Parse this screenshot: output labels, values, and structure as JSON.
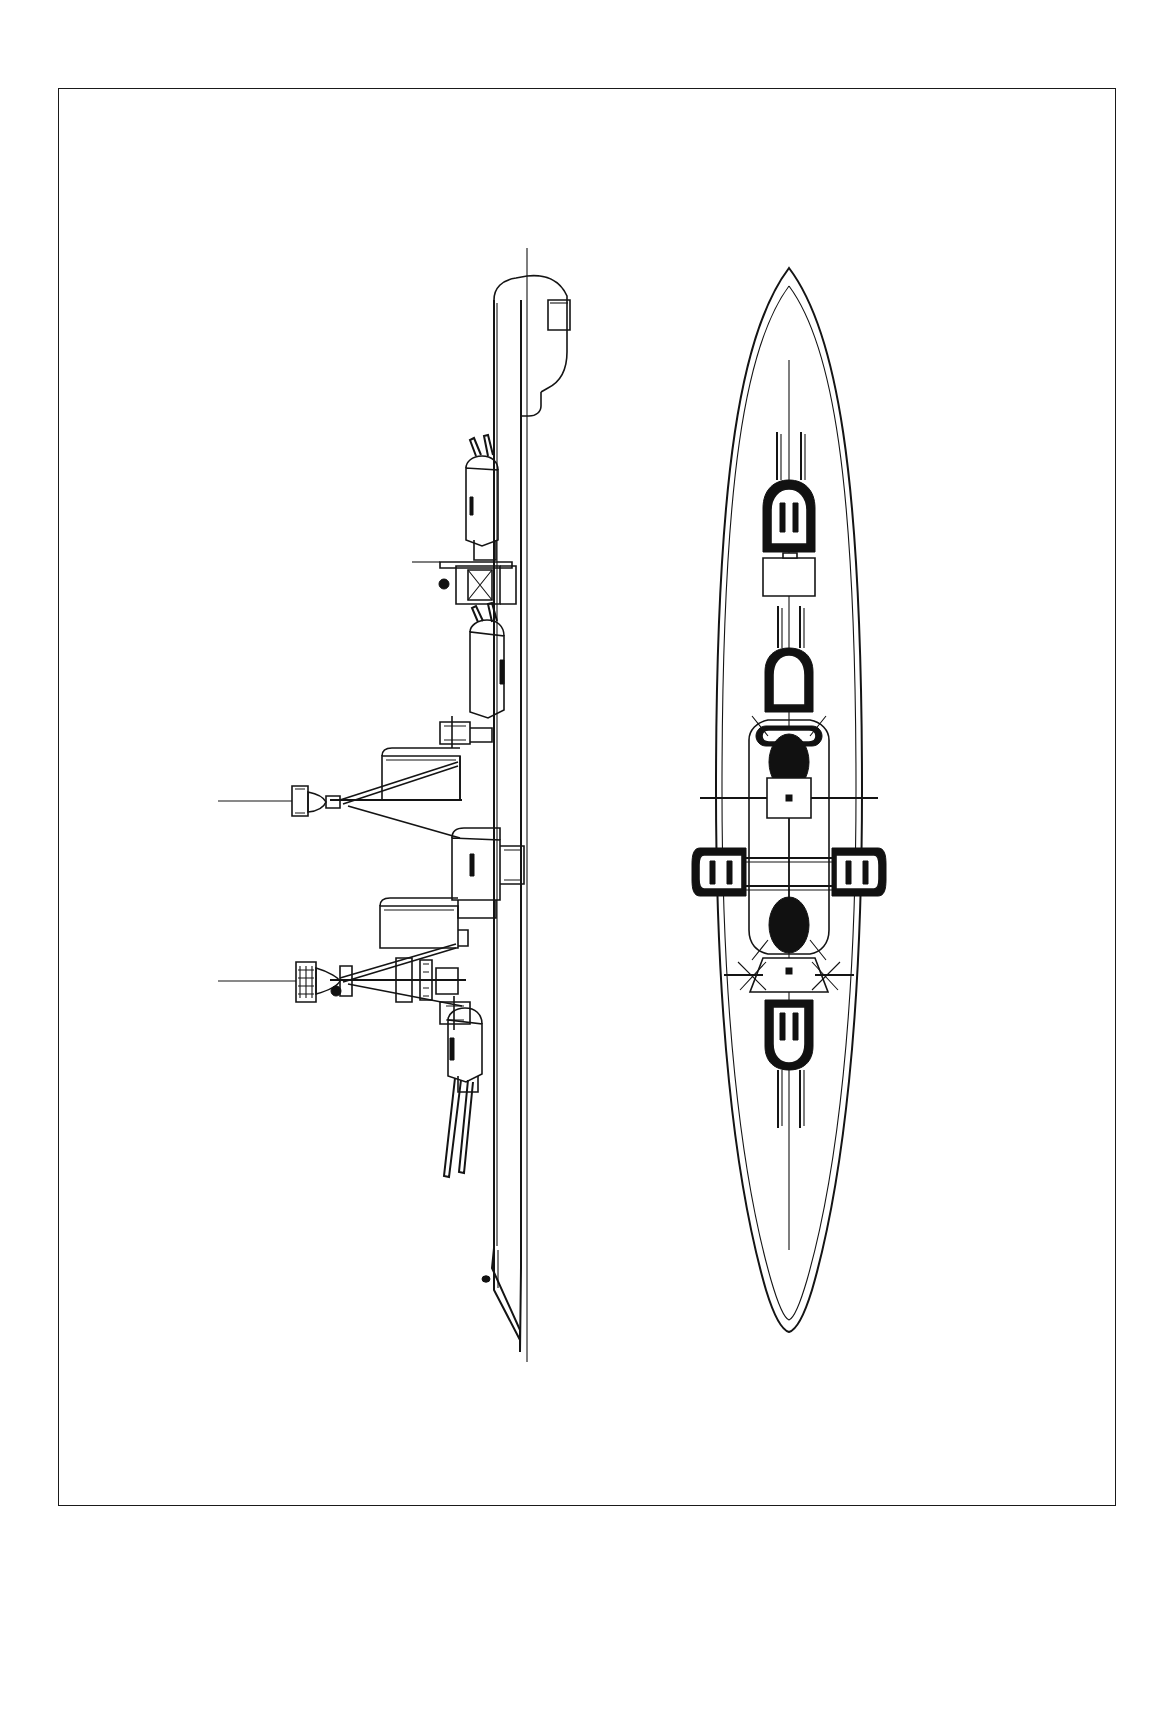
{
  "sheet": {
    "title": "Battleship general arrangement drawing",
    "background_color": "#ffffff",
    "line_color": "#1a1a1a",
    "width_px": 1174,
    "height_px": 1716,
    "orientation": "portrait, ship drawn rotated 90 degrees (bow toward bottom of sheet)"
  },
  "frame": {
    "name": "drawing-border",
    "x": 58,
    "y": 88,
    "width": 1058,
    "height": 1418,
    "stroke": "#1a1a1a",
    "stroke_width": 1.5
  },
  "views": {
    "elevation": {
      "label": "side elevation",
      "centerline_x": 527,
      "bow_y": 1360,
      "stern_y": 248,
      "hull_left_x": 466,
      "hull_right_x": 583
    },
    "plan": {
      "label": "deck plan view",
      "centerline_x": 789,
      "bow_y": 1330,
      "stern_y": 268,
      "beam_half_width": 73
    }
  },
  "armament": {
    "main_turrets": [
      {
        "name": "turret-a",
        "position": "forward superfiring",
        "guns": 2,
        "plan_x": 789,
        "plan_y": 1045,
        "bearing": "aft"
      },
      {
        "name": "turret-b",
        "position": "forward",
        "guns": 2,
        "plan_x": 789,
        "plan_y": 686,
        "bearing": "forward"
      },
      {
        "name": "turret-port",
        "position": "port wing",
        "guns": 2,
        "plan_x": 723,
        "plan_y": 871,
        "bearing": "abeam"
      },
      {
        "name": "turret-starboard",
        "position": "starboard wing",
        "guns": 2,
        "plan_x": 851,
        "plan_y": 871,
        "bearing": "abeam"
      },
      {
        "name": "turret-aft",
        "position": "aft",
        "guns": 2,
        "plan_x": 789,
        "plan_y": 519,
        "bearing": "forward"
      }
    ],
    "turret_count": 5,
    "guns_per_turret": 2,
    "total_main_guns": 10
  },
  "structures": {
    "funnels": [
      {
        "name": "funnel-forward",
        "plan_x": 789,
        "plan_y": 760
      },
      {
        "name": "funnel-aft",
        "plan_x": 789,
        "plan_y": 925
      }
    ],
    "masts": [
      {
        "name": "mast-forward",
        "elevation_x": 305,
        "elevation_y": 800,
        "has_fighting_top": true
      },
      {
        "name": "mast-aft",
        "elevation_x": 308,
        "elevation_y": 980,
        "has_fighting_top": true
      }
    ],
    "conning_tower": {
      "name": "conning-tower",
      "plan_x": 789,
      "plan_y": 798
    },
    "deckhouse": {
      "name": "deckhouse",
      "plan_x": 789,
      "plan_y": 576
    },
    "boat_deck": {
      "name": "boat-deck",
      "plan_x": 789,
      "plan_y": 968
    }
  },
  "hull_detail": {
    "anchor_hawse": {
      "name": "anchor-hawse",
      "elevation_x": 486,
      "elevation_y": 1279
    },
    "stern_shape": "rounded counter",
    "bow_shape": "raked stem"
  }
}
